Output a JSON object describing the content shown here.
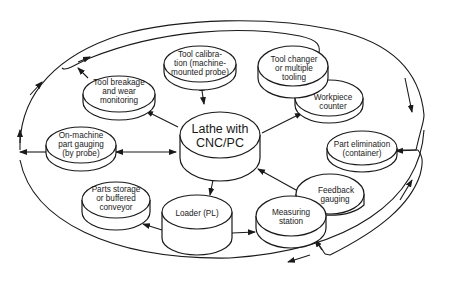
{
  "diagram": {
    "type": "system-flow",
    "center": {
      "label_line1": "Lathe with",
      "label_line2": "CNC/PC"
    },
    "nodes": {
      "tool_calibration": {
        "lines": [
          "Tool calibra-",
          "tion (machine-",
          "mounted probe)"
        ]
      },
      "tool_changer": {
        "lines": [
          "Tool changer",
          "or multiple",
          "tooling"
        ]
      },
      "workpiece_counter": {
        "lines": [
          "Workpiece",
          "counter"
        ]
      },
      "tool_breakage": {
        "lines": [
          "Tool breakage",
          "and wear",
          "monitoring"
        ]
      },
      "on_machine_gauging": {
        "lines": [
          "On-machine",
          "part gauging",
          "(by probe)"
        ]
      },
      "part_elimination": {
        "lines": [
          "Part elimination",
          "(container)"
        ]
      },
      "parts_storage": {
        "lines": [
          "Parts storage",
          "or buffered",
          "conveyor"
        ]
      },
      "loader": {
        "lines": [
          "Loader (PL)"
        ]
      },
      "measuring_station": {
        "lines": [
          "Measuring",
          "station"
        ]
      },
      "feedback_gauging": {
        "lines": [
          "Feedback",
          "gauging"
        ]
      }
    },
    "connections": [
      {
        "from": "center",
        "to": "tool_calibration",
        "direction": "both"
      },
      {
        "from": "center",
        "to": "tool_breakage",
        "direction": "forward"
      },
      {
        "from": "center",
        "to": "workpiece_counter",
        "direction": "forward"
      },
      {
        "from": "center",
        "to": "on_machine_gauging",
        "direction": "both"
      },
      {
        "from": "center",
        "to": "loader",
        "direction": "forward"
      },
      {
        "from": "feedback_gauging",
        "to": "center",
        "direction": "forward"
      },
      {
        "from": "loader",
        "to": "parts_storage",
        "direction": "forward"
      },
      {
        "from": "loader",
        "to": "measuring_station",
        "direction": "forward"
      },
      {
        "from": "outer_loop",
        "to": "part_elimination",
        "direction": "forward"
      },
      {
        "from": "outer_loop",
        "to": "measuring_station",
        "direction": "forward"
      }
    ]
  }
}
